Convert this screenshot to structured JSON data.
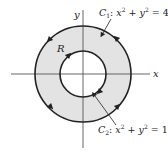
{
  "diagram": {
    "axes": {
      "x_label": "x",
      "y_label": "y"
    },
    "region_label": "R",
    "outer_curve": {
      "name": "C",
      "subscript": "1",
      "equation_lhs": "x",
      "equation_mid": " + y",
      "equation_rhs": " = 4",
      "exponent": "2",
      "radius": 2,
      "orientation": "counterclockwise"
    },
    "inner_curve": {
      "name": "C",
      "subscript": "2",
      "equation_lhs": "x",
      "equation_mid": " + y",
      "equation_rhs": " = 1",
      "exponent": "2",
      "radius": 1,
      "orientation": "clockwise"
    },
    "colors": {
      "region_fill": "#e3e3e3",
      "stroke": "#222222",
      "axis": "#555555"
    }
  }
}
